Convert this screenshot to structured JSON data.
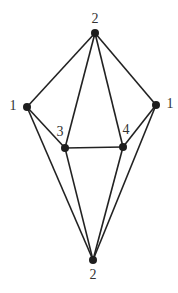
{
  "diagram": {
    "type": "graph",
    "node_color": "#1e1e1e",
    "edge_color": "#222222",
    "nodes": [
      {
        "id": "top",
        "label": "2",
        "x": 95,
        "y": 33,
        "lx": 95,
        "ly": 20
      },
      {
        "id": "left",
        "label": "1",
        "x": 27,
        "y": 107,
        "lx": 13,
        "ly": 107
      },
      {
        "id": "right",
        "label": "1",
        "x": 156,
        "y": 105,
        "lx": 170,
        "ly": 105
      },
      {
        "id": "n3",
        "label": "3",
        "x": 65,
        "y": 148,
        "lx": 60,
        "ly": 133
      },
      {
        "id": "n4",
        "label": "4",
        "x": 123,
        "y": 147,
        "lx": 126,
        "ly": 131
      },
      {
        "id": "bottom",
        "label": "2",
        "x": 93,
        "y": 260,
        "lx": 93,
        "ly": 276
      }
    ],
    "edges": [
      [
        "top",
        "left"
      ],
      [
        "top",
        "right"
      ],
      [
        "top",
        "n3"
      ],
      [
        "top",
        "n4"
      ],
      [
        "left",
        "n3"
      ],
      [
        "right",
        "n4"
      ],
      [
        "n3",
        "n4"
      ],
      [
        "left",
        "bottom"
      ],
      [
        "right",
        "bottom"
      ],
      [
        "n3",
        "bottom"
      ],
      [
        "n4",
        "bottom"
      ]
    ]
  }
}
